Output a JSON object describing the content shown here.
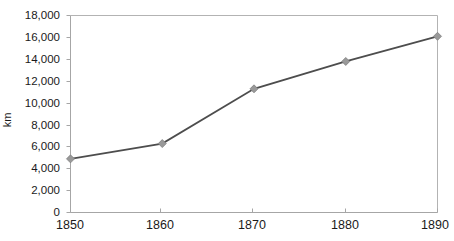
{
  "chart_data": {
    "type": "line",
    "title": "",
    "subtitle": "",
    "xlabel": "",
    "ylabel": "km",
    "x": [
      1850,
      1860,
      1870,
      1880,
      1890
    ],
    "xtick_labels": [
      "1850",
      "1860",
      "1870",
      "1880",
      "1890"
    ],
    "values": [
      4900,
      6300,
      11300,
      13800,
      16100
    ],
    "series": [
      {
        "name": "km",
        "values": [
          4900,
          6300,
          11300,
          13800,
          16100
        ]
      }
    ],
    "ytick_labels": [
      "18,000",
      "16,000",
      "14,000",
      "12,000",
      "10,000",
      "8,000",
      "6,000",
      "4,000",
      "2,000",
      "0"
    ],
    "ytick_values": [
      18000,
      16000,
      14000,
      12000,
      10000,
      8000,
      6000,
      4000,
      2000,
      0
    ],
    "ylim": [
      0,
      18000
    ],
    "xlim": [
      1850,
      1890
    ],
    "grid": false,
    "legend": "none",
    "line_color": "#4d4d4d",
    "marker_color": "#999999",
    "marker_shape": "diamond",
    "axis_color": "#a6a6a6",
    "text_color": "#1a1a1a",
    "background_color": "#ffffff"
  }
}
